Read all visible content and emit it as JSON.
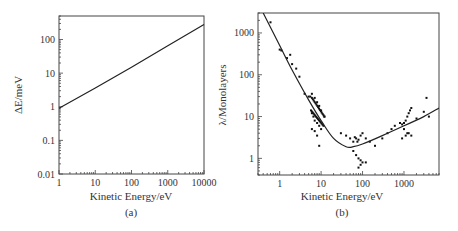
{
  "chart_data": [
    {
      "id": "a",
      "type": "line",
      "panel_label": "(a)",
      "title": "",
      "xlabel": "Kinetic Energy/eV",
      "ylabel": "ΔE/meV",
      "xscale": "log",
      "yscale": "log",
      "xlim": [
        1,
        10000
      ],
      "ylim": [
        0.01,
        500
      ],
      "xticks": [
        "1",
        "10",
        "100",
        "1000",
        "10000"
      ],
      "yticks": [
        "0.01",
        "0.1",
        "1",
        "10",
        "100"
      ],
      "grid": false,
      "legend": null,
      "series": [
        {
          "name": "ΔE",
          "x": [
            1,
            10,
            100,
            1000,
            10000
          ],
          "y": [
            0.9,
            3.6,
            15,
            65,
            280
          ]
        }
      ]
    },
    {
      "id": "b",
      "type": "scatter",
      "panel_label": "(b)",
      "title": "",
      "xlabel": "Kinetic Energy/eV",
      "ylabel": "λ/Monolayers",
      "xscale": "log",
      "yscale": "log",
      "xlim": [
        0.3,
        7000
      ],
      "ylim": [
        0.4,
        3000
      ],
      "xticks": [
        "1",
        "10",
        "100",
        "1000"
      ],
      "yticks": [
        "1",
        "10",
        "100",
        "1000"
      ],
      "grid": false,
      "legend": null,
      "series": [
        {
          "name": "universal curve",
          "kind": "line",
          "x": [
            0.4,
            1,
            2,
            5,
            10,
            20,
            40,
            60,
            100,
            300,
            1000,
            3000,
            7000
          ],
          "y": [
            3000,
            500,
            130,
            25,
            8,
            3,
            1.9,
            1.9,
            2.2,
            3.5,
            6,
            10,
            16
          ]
        },
        {
          "name": "measurements",
          "kind": "scatter",
          "x": [
            0.6,
            1,
            1.1,
            1.5,
            1.8,
            2,
            2.5,
            3,
            4,
            5,
            5.5,
            6,
            7,
            8,
            9,
            10,
            12,
            6,
            6.5,
            7,
            8,
            9,
            10,
            6,
            7,
            8,
            9,
            30,
            40,
            50,
            60,
            65,
            70,
            75,
            80,
            90,
            100,
            120,
            150,
            200,
            60,
            70,
            80,
            90,
            100,
            120,
            80,
            90,
            300,
            400,
            500,
            600,
            800,
            900,
            1000,
            1100,
            1200,
            1300,
            1400,
            1500,
            1000,
            1200,
            1500,
            2000,
            3000,
            3500,
            4000,
            900,
            1100,
            1300
          ],
          "y": [
            1800,
            400,
            380,
            250,
            300,
            180,
            140,
            90,
            35,
            30,
            30,
            35,
            28,
            22,
            18,
            14,
            10,
            12,
            10,
            8,
            7,
            6,
            5,
            5,
            4.5,
            3.5,
            2,
            4,
            3.5,
            3,
            2.5,
            3.2,
            3,
            2.5,
            2.8,
            3.5,
            4,
            3,
            2.5,
            2,
            1.5,
            1.2,
            1,
            0.9,
            0.8,
            0.8,
            0.6,
            0.7,
            3,
            4,
            5,
            6,
            7,
            6.5,
            7,
            8,
            10,
            12,
            14,
            16,
            5,
            4,
            3.5,
            9,
            13,
            28,
            10,
            3,
            3.5,
            4
          ]
        }
      ]
    }
  ]
}
